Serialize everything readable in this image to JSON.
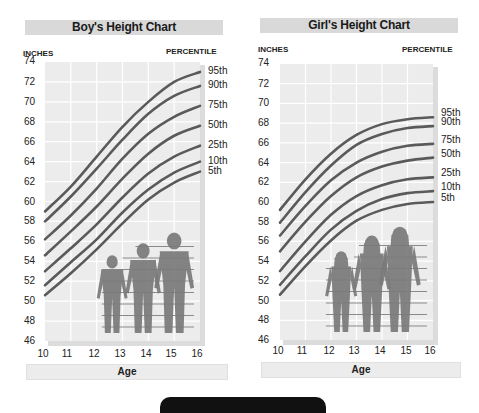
{
  "boys": {
    "title": "Boy's Height Chart",
    "y_caption": "INCHES",
    "pct_caption": "PERCENTILE",
    "x_label": "Age"
  },
  "girls": {
    "title": "Girl's Height Chart",
    "y_caption": "INCHES",
    "pct_caption": "PERCENTILE",
    "x_label": "Age"
  },
  "colors": {
    "title_bar": "#d9d9d9",
    "plot_bg": "#ececec",
    "grid": "#ffffff",
    "curve": "#5a5a5a",
    "figure": "#7a7a7a"
  },
  "chart_data": [
    {
      "type": "line",
      "title": "Boy's Height Chart",
      "xlabel": "Age",
      "ylabel": "INCHES",
      "legend_title": "PERCENTILE",
      "x": [
        10,
        11,
        12,
        13,
        14,
        15,
        16
      ],
      "x_tick_labels": [
        "10",
        "11",
        "12",
        "13",
        "14",
        "15",
        "16"
      ],
      "y_ticks": [
        46,
        48,
        50,
        52,
        54,
        56,
        58,
        60,
        62,
        64,
        66,
        68,
        70,
        72,
        74
      ],
      "ylim": [
        46,
        74
      ],
      "grid": true,
      "legend_position": "right",
      "series": [
        {
          "name": "95th",
          "values": [
            59.0,
            61.5,
            64.5,
            67.5,
            70.0,
            72.0,
            73.0
          ]
        },
        {
          "name": "90th",
          "values": [
            58.0,
            60.5,
            63.3,
            66.2,
            68.8,
            70.6,
            71.6
          ]
        },
        {
          "name": "75th",
          "values": [
            56.2,
            58.6,
            61.3,
            64.3,
            66.8,
            68.5,
            69.6
          ]
        },
        {
          "name": "50th",
          "values": [
            54.6,
            57.0,
            59.5,
            62.3,
            64.8,
            66.6,
            67.6
          ]
        },
        {
          "name": "25th",
          "values": [
            53.0,
            55.3,
            57.7,
            60.4,
            62.8,
            64.5,
            65.6
          ]
        },
        {
          "name": "10th",
          "values": [
            51.6,
            53.9,
            56.2,
            58.9,
            61.2,
            62.9,
            64.0
          ]
        },
        {
          "name": "5th",
          "values": [
            50.6,
            52.8,
            55.2,
            57.8,
            60.2,
            61.9,
            63.0
          ]
        }
      ]
    },
    {
      "type": "line",
      "title": "Girl's Height Chart",
      "xlabel": "Age",
      "ylabel": "INCHES",
      "legend_title": "PERCENTILE",
      "x": [
        10,
        11,
        12,
        13,
        14,
        15,
        16
      ],
      "x_tick_labels": [
        "10",
        "11",
        "12",
        "13",
        "14",
        "15",
        "16"
      ],
      "y_ticks": [
        46,
        48,
        50,
        52,
        54,
        56,
        58,
        60,
        62,
        64,
        66,
        68,
        70,
        72,
        74
      ],
      "ylim": [
        46,
        74
      ],
      "grid": true,
      "legend_position": "right",
      "series": [
        {
          "name": "95th",
          "values": [
            59.2,
            62.3,
            64.9,
            66.8,
            67.9,
            68.4,
            68.6
          ]
        },
        {
          "name": "90th",
          "values": [
            57.9,
            61.0,
            63.7,
            65.8,
            66.9,
            67.5,
            67.7
          ]
        },
        {
          "name": "75th",
          "values": [
            56.6,
            59.6,
            62.2,
            64.0,
            65.1,
            65.7,
            65.9
          ]
        },
        {
          "name": "50th",
          "values": [
            55.0,
            58.0,
            60.6,
            62.5,
            63.6,
            64.2,
            64.5
          ]
        },
        {
          "name": "25th",
          "values": [
            53.0,
            56.0,
            58.7,
            60.6,
            61.7,
            62.3,
            62.5
          ]
        },
        {
          "name": "10th",
          "values": [
            51.6,
            54.5,
            57.2,
            59.1,
            60.3,
            60.9,
            61.1
          ]
        },
        {
          "name": "5th",
          "values": [
            50.6,
            53.5,
            56.1,
            58.1,
            59.2,
            59.8,
            60.0
          ]
        }
      ]
    }
  ]
}
